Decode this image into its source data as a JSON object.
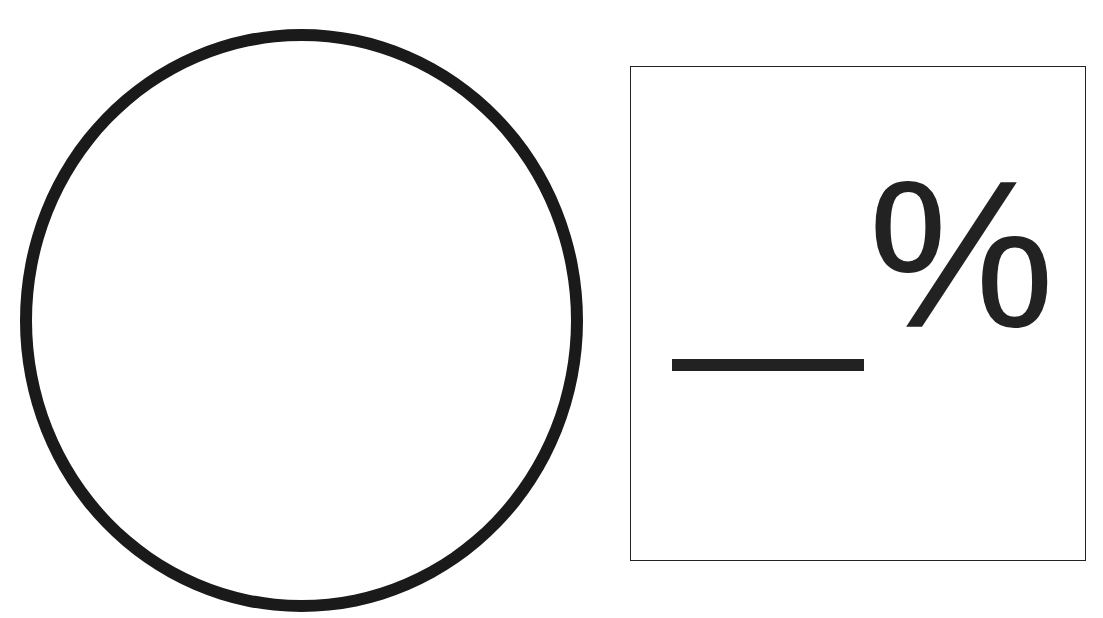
{
  "figure": {
    "shape": "circle",
    "answer_box": {
      "blank": "",
      "unit_symbol": "%"
    }
  }
}
